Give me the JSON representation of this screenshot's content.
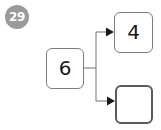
{
  "badge": {
    "label": "29",
    "color": "#9a9a9a",
    "text_color": "#ffffff"
  },
  "diagram": {
    "type": "number-bond-flowchart",
    "line_color": "#7d7d7d",
    "arrow_color": "#1a1a1a",
    "nodes": [
      {
        "id": "source",
        "value": "6",
        "role": "source",
        "filled": true,
        "border_color": "#7d7d7d"
      },
      {
        "id": "target-top",
        "value": "4",
        "role": "target",
        "filled": true,
        "border_color": "#7d7d7d"
      },
      {
        "id": "target-bottom",
        "value": "",
        "role": "target",
        "filled": false,
        "border_color": "#5a5a5a"
      }
    ],
    "edges": [
      {
        "from": "source",
        "to": "target-top",
        "arrow": "right"
      },
      {
        "from": "source",
        "to": "target-bottom",
        "arrow": "right"
      }
    ]
  }
}
